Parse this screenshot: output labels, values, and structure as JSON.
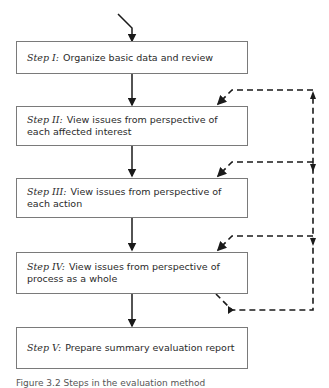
{
  "steps": [
    {
      "label": "Step I:",
      "text": "Organize basic data and review"
    },
    {
      "label": "Step II:",
      "text": "View issues from perspective of each affected interest"
    },
    {
      "label": "Step III:",
      "text": "View issues from perspective of each action"
    },
    {
      "label": "Step IV:",
      "text": "View issues from perspective of process as a whole"
    },
    {
      "label": "Step V:",
      "text": "Prepare summary evaluation report"
    }
  ],
  "caption": "Figure 3.2 Steps in the evaluation method",
  "colors": {
    "line": "#1a1a1a",
    "box_border": "#7a7a7a"
  }
}
